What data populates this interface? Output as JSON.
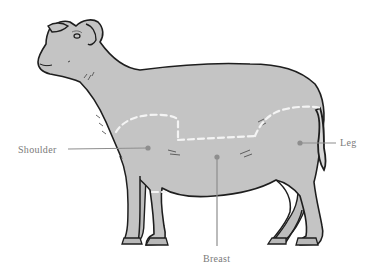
{
  "diagram": {
    "colors": {
      "background": "#ffffff",
      "body_fill": "#c4c4c4",
      "outline": "#1e1e1e",
      "cut_lines": "#f4f4f4",
      "leader_lines": "#8e8e8e",
      "label_text": "#7a7a7a"
    },
    "labels": [
      {
        "id": "shoulder",
        "text": "Shoulder"
      },
      {
        "id": "leg",
        "text": "Leg"
      },
      {
        "id": "breast",
        "text": "Breast"
      }
    ]
  }
}
